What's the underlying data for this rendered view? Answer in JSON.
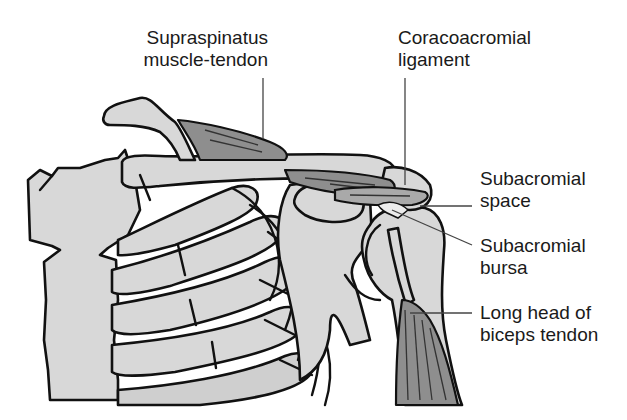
{
  "figure": {
    "colors": {
      "bone": "#d8d8d8",
      "muscle": "#8e8e8e",
      "outline": "#111111",
      "leader": "#444444",
      "background": "#ffffff"
    }
  },
  "labels": [
    {
      "id": "supraspinatus",
      "lines": [
        "Supraspinatus",
        "muscle-tendon"
      ],
      "align": "right"
    },
    {
      "id": "coracoacromial",
      "lines": [
        "Coracoacromial",
        "ligament"
      ],
      "align": "left"
    },
    {
      "id": "subacromial-space",
      "lines": [
        "Subacromial",
        "space"
      ],
      "align": "left"
    },
    {
      "id": "subacromial-bursa",
      "lines": [
        "Subacromial",
        "bursa"
      ],
      "align": "left"
    },
    {
      "id": "biceps",
      "lines": [
        "Long head of",
        "biceps tendon"
      ],
      "align": "left"
    }
  ]
}
